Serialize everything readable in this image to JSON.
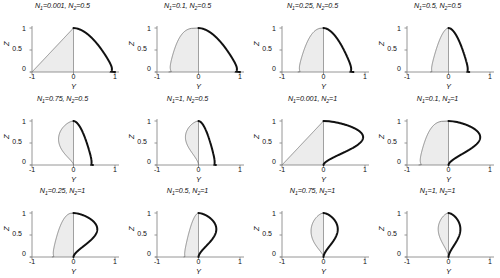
{
  "figure": {
    "axis_labels": {
      "x": "Y",
      "y": "Z"
    },
    "x_ticks": [
      "-1",
      "0",
      "1"
    ],
    "y_ticks": [
      "0",
      "0.5",
      "1"
    ],
    "x_range": [
      -1,
      1
    ],
    "y_range": [
      0,
      1
    ],
    "colors": {
      "left_curve": "#6b6b6b",
      "right_curve": "#111111",
      "fill_left": "#ececec",
      "axis": "#8a8a8a",
      "background": "#ffffff"
    }
  },
  "chart_data": {
    "type": "line",
    "title": "",
    "xlabel": "Y",
    "ylabel": "Z",
    "xlim": [
      -1,
      1
    ],
    "ylim": [
      0,
      1
    ],
    "grid": false,
    "legend": "none",
    "panels": [
      {
        "index": 0,
        "row": 0,
        "col": 0,
        "title": "N₁=0.001, N₂=0.5",
        "N1": 0.001,
        "N2": 0.5,
        "label_parts": {
          "n1_value": "0.001",
          "n2_value": "0.5"
        },
        "x_ticks": [
          "-1",
          "0",
          "1"
        ],
        "y_ticks": [
          "0",
          "0.5",
          "1"
        ],
        "left_extent": -1.0,
        "right_extent": 1.0,
        "left_shape": "near-linear taper to (-1,0)",
        "right_shape": "convex quarter lobe reaching (1,0)"
      },
      {
        "index": 1,
        "row": 0,
        "col": 1,
        "title": "N₁=0.1, N₂=0.5",
        "N1": 0.1,
        "N2": 0.5,
        "label_parts": {
          "n1_value": "0.1",
          "n2_value": "0.5"
        },
        "x_ticks": [
          "-1",
          "0",
          "1"
        ],
        "y_ticks": [
          "0",
          "0.5",
          "1"
        ],
        "left_extent": -0.72,
        "right_extent": 1.0,
        "left_shape": "broad rounded lobe",
        "right_shape": "convex quarter lobe reaching (1,0)"
      },
      {
        "index": 2,
        "row": 0,
        "col": 2,
        "title": "N₁=0.25, N₂=0.5",
        "N1": 0.25,
        "N2": 0.5,
        "label_parts": {
          "n1_value": "0.25",
          "n2_value": "0.5"
        },
        "x_ticks": [
          "-1",
          "0",
          "1"
        ],
        "y_ticks": [
          "0",
          "0.5",
          "1"
        ],
        "left_extent": -0.62,
        "right_extent": 0.72,
        "left_shape": "rounded lobe",
        "right_shape": "rounded thick lobe"
      },
      {
        "index": 3,
        "row": 0,
        "col": 3,
        "title": "N₁=0.5, N₂=0.5",
        "N1": 0.5,
        "N2": 0.5,
        "label_parts": {
          "n1_value": "0.5",
          "n2_value": "0.5"
        },
        "x_ticks": [
          "-1",
          "0",
          "1"
        ],
        "y_ticks": [
          "0",
          "0.5",
          "1"
        ],
        "left_extent": -0.44,
        "right_extent": 0.5,
        "left_shape": "circular half",
        "right_shape": "circular half"
      },
      {
        "index": 4,
        "row": 1,
        "col": 0,
        "title": "N₁=0.75, N₂=0.5",
        "N1": 0.75,
        "N2": 0.5,
        "label_parts": {
          "n1_value": "0.75",
          "n2_value": "0.5"
        },
        "x_ticks": [
          "-1",
          "0",
          "1"
        ],
        "y_ticks": [
          "0",
          "0.5",
          "1"
        ],
        "left_extent": -0.36,
        "right_extent": 0.47,
        "left_shape": "narrow teardrop",
        "right_shape": "rounded lobe"
      },
      {
        "index": 5,
        "row": 1,
        "col": 1,
        "title": "N₁=1, N₂=0.5",
        "N1": 1,
        "N2": 0.5,
        "label_parts": {
          "n1_value": "1",
          "n2_value": "0.5"
        },
        "x_ticks": [
          "-1",
          "0",
          "1"
        ],
        "y_ticks": [
          "0",
          "0.5",
          "1"
        ],
        "left_extent": -0.33,
        "right_extent": 0.42,
        "left_shape": "teardrop pointed at origin",
        "right_shape": "rounded teardrop"
      },
      {
        "index": 6,
        "row": 1,
        "col": 2,
        "title": "N₁=0.001, N₂=1",
        "N1": 0.001,
        "N2": 1,
        "label_parts": {
          "n1_value": "0.001",
          "n2_value": "1"
        },
        "x_ticks": [
          "-1",
          "0",
          "1"
        ],
        "y_ticks": [
          "0",
          "0.5",
          "1"
        ],
        "left_extent": -1.0,
        "right_extent": 1.0,
        "left_shape": "straight line to (-1,0)",
        "right_shape": "straight line to (1,0) forming triangle"
      },
      {
        "index": 7,
        "row": 1,
        "col": 3,
        "title": "N₁=0.1, N₂=1",
        "N1": 0.1,
        "N2": 1,
        "label_parts": {
          "n1_value": "0.1",
          "n2_value": "1"
        },
        "x_ticks": [
          "-1",
          "0",
          "1"
        ],
        "y_ticks": [
          "0",
          "0.5",
          "1"
        ],
        "left_extent": -0.72,
        "right_extent": 0.8,
        "left_shape": "broad rounded lobe",
        "right_shape": "broad lobe with straightened flank"
      },
      {
        "index": 8,
        "row": 2,
        "col": 0,
        "title": "N₁=0.25, N₂=1",
        "N1": 0.25,
        "N2": 1,
        "label_parts": {
          "n1_value": "0.25",
          "n2_value": "1"
        },
        "x_ticks": [
          "-1",
          "0",
          "1"
        ],
        "y_ticks": [
          "0",
          "0.5",
          "1"
        ],
        "left_extent": -0.52,
        "right_extent": 0.6,
        "left_shape": "rounded lobe",
        "right_shape": "rounded lobe with flat base"
      },
      {
        "index": 9,
        "row": 2,
        "col": 1,
        "title": "N₁=0.5, N₂=1",
        "N1": 0.5,
        "N2": 1,
        "label_parts": {
          "n1_value": "0.5",
          "n2_value": "1"
        },
        "x_ticks": [
          "-1",
          "0",
          "1"
        ],
        "y_ticks": [
          "0",
          "0.5",
          "1"
        ],
        "left_extent": -0.36,
        "right_extent": 0.45,
        "left_shape": "narrow lobe",
        "right_shape": "teardrop lobe"
      },
      {
        "index": 10,
        "row": 2,
        "col": 2,
        "title": "N₁=0.75, N₂=1",
        "N1": 0.75,
        "N2": 1,
        "label_parts": {
          "n1_value": "0.75",
          "n2_value": "1"
        },
        "x_ticks": [
          "-1",
          "0",
          "1"
        ],
        "y_ticks": [
          "0",
          "0.5",
          "1"
        ],
        "left_extent": -0.3,
        "right_extent": 0.36,
        "left_shape": "slender leaf",
        "right_shape": "slender leaf"
      },
      {
        "index": 11,
        "row": 2,
        "col": 3,
        "title": "N₁=1, N₂=1",
        "N1": 1,
        "N2": 1,
        "label_parts": {
          "n1_value": "1",
          "n2_value": "1"
        },
        "x_ticks": [
          "-1",
          "0",
          "1"
        ],
        "y_ticks": [
          "0",
          "0.5",
          "1"
        ],
        "left_extent": -0.26,
        "right_extent": 0.3,
        "left_shape": "pointed lens half",
        "right_shape": "pointed lens half"
      }
    ]
  }
}
